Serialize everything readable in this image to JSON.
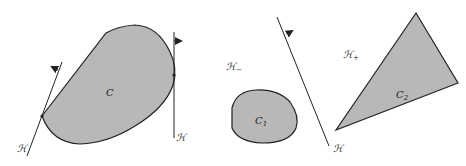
{
  "figure": {
    "left_panel": {
      "convex_set_label": "C",
      "hyperplane_labels": [
        "ℋ",
        "ℋ"
      ],
      "fill_color": "#b8b8b8",
      "stroke_color": "#222222"
    },
    "right_panel": {
      "set1_label": "C",
      "set1_sub": "1",
      "set2_label": "C",
      "set2_sub": "2",
      "hyperplane_label": "ℋ",
      "halfspace_minus_label": "ℋ",
      "halfspace_minus_sub": "−",
      "halfspace_plus_label": "ℋ",
      "halfspace_plus_sub": "+"
    }
  }
}
